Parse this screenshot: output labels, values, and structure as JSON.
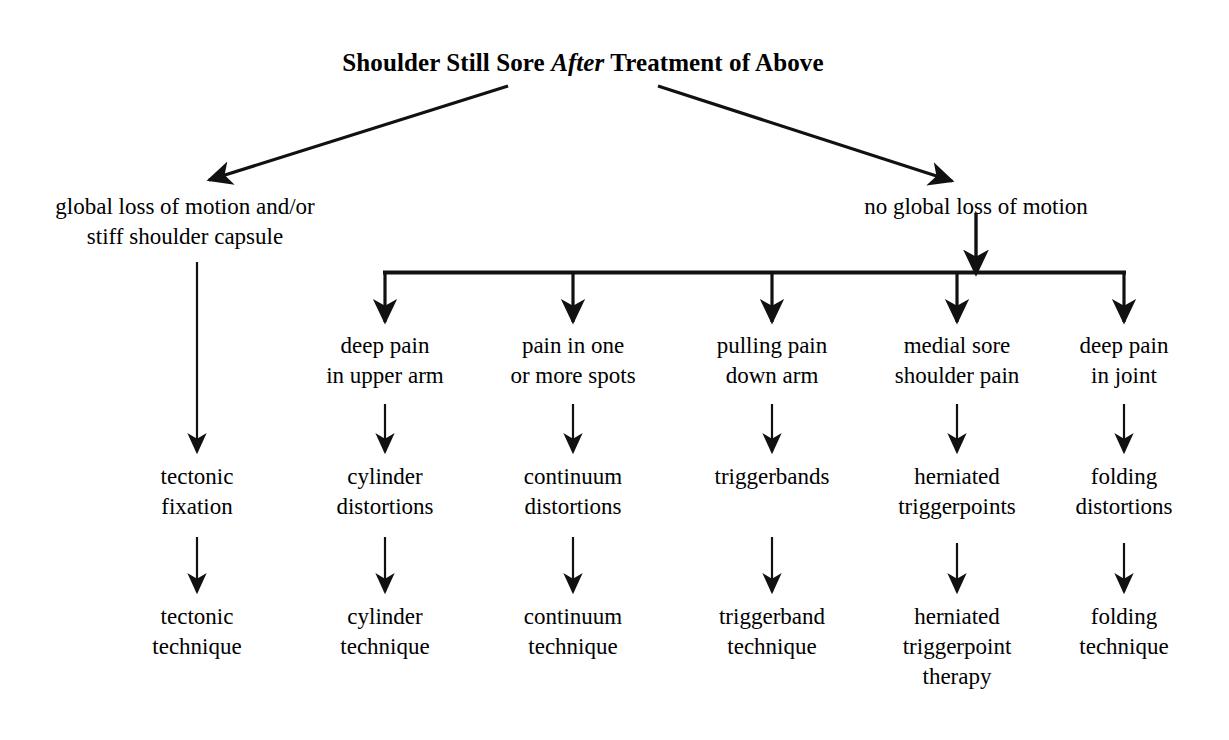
{
  "diagram": {
    "title": {
      "prefix": "Shoulder Still Sore ",
      "emphasis": "After",
      "suffix": " Treatment of Above",
      "full": "Shoulder Still Sore After Treatment of Above"
    },
    "colors": {
      "background": "#ffffff",
      "ink": "#000000"
    },
    "branches": {
      "left": "global loss of motion and/or\nstiff shoulder capsule",
      "right": "no global loss of motion"
    },
    "columns": [
      {
        "symptom": "",
        "diagnosis": "tectonic\nfixation",
        "technique": "tectonic\ntechnique"
      },
      {
        "symptom": "deep pain\nin upper arm",
        "diagnosis": "cylinder\ndistortions",
        "technique": "cylinder\ntechnique"
      },
      {
        "symptom": "pain in one\nor more spots",
        "diagnosis": "continuum\ndistortions",
        "technique": "continuum\ntechnique"
      },
      {
        "symptom": "pulling pain\ndown arm",
        "diagnosis": "triggerbands",
        "technique": "triggerband\ntechnique"
      },
      {
        "symptom": "medial sore\nshoulder pain",
        "diagnosis": "herniated\ntriggerpoints",
        "technique": "herniated\ntriggerpoint\ntherapy"
      },
      {
        "symptom": "deep pain\nin joint",
        "diagnosis": "folding\ndistortions",
        "technique": "folding\ntechnique"
      }
    ]
  }
}
